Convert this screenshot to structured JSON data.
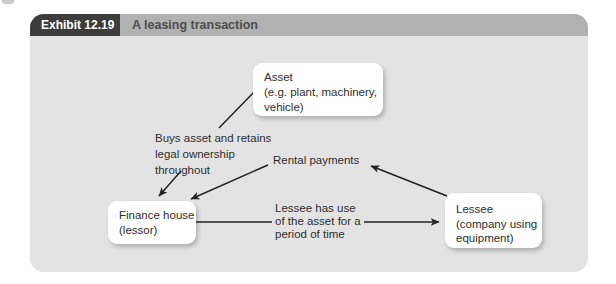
{
  "exhibit": {
    "label": "Exhibit 12.19",
    "title": "A leasing transaction"
  },
  "nodes": {
    "asset": {
      "lines": [
        "Asset",
        "(e.g. plant, machinery,",
        "vehicle)"
      ]
    },
    "finance_house": {
      "lines": [
        "Finance house",
        "(lessor)"
      ]
    },
    "lessee": {
      "lines": [
        "Lessee",
        "(company using",
        "equipment)"
      ]
    }
  },
  "labels": {
    "buys_asset": {
      "lines": [
        "Buys asset and retains",
        "legal ownership",
        "throughout"
      ]
    },
    "rental_payments": {
      "lines": [
        "Rental payments"
      ]
    },
    "lessee_use": {
      "lines": [
        "Lessee has use",
        "of the asset for a",
        "period of time"
      ]
    }
  },
  "colors": {
    "panel_bg": "#e3e3e3",
    "header_bar": "#b1b1b1",
    "header_label_bg": "#3d3d3d",
    "header_label_text": "#ffffff",
    "header_title_text": "#4e4e4e",
    "node_bg": "#ffffff",
    "text": "#2e2e2e",
    "line": "#222222"
  }
}
